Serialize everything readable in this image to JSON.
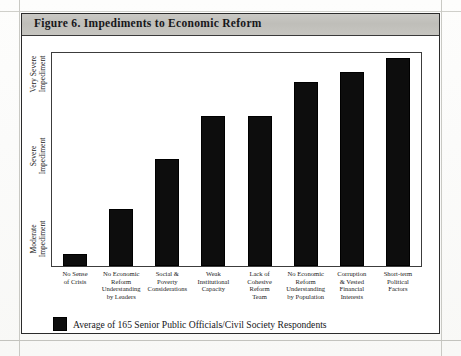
{
  "figure": {
    "title": "Figure 6.  Impediments to Economic Reform"
  },
  "chart_data": {
    "type": "bar",
    "title": "Figure 6.  Impediments to Economic Reform",
    "xlabel": "",
    "ylabel": "",
    "grid": false,
    "legend_position": "bottom-left",
    "orientation": "vertical",
    "bar_color": "#0d0d0d",
    "ylim": [
      0.63,
      3.22
    ],
    "ytick_values": [
      1,
      2,
      3
    ],
    "ytick_labels": [
      "Moderate\nImpediment",
      "Severe\nImpediment",
      "Very Severe\nImpediment"
    ],
    "categories": [
      "No Sense\nof Crisis",
      "No Economic\nReform\nUnderstanding\nby Leaders",
      "Social &\nPoverty\nConsiderations",
      "Weak\nInstitutional\nCapacity",
      "Lack of\nCohesive\nReform\nTeam",
      "No Economic\nReform\nUnderstanding\nby Population",
      "Corruption\n& Vested\nFinancial\nInterests",
      "Short-term\nPolitical\nFactors"
    ],
    "series": [
      {
        "name": "Average of 165 Senior Public Officials/Civil Society Respondents",
        "values": [
          0.78,
          1.32,
          1.93,
          2.45,
          2.45,
          2.87,
          2.99,
          3.16
        ]
      }
    ],
    "bar_pixel_heights": [
      12,
      57,
      107,
      150,
      150,
      184,
      194,
      208
    ]
  },
  "legend": {
    "label": "Average of 165 Senior Public Officials/Civil Society Respondents",
    "swatch_color": "#0d0d0d"
  }
}
